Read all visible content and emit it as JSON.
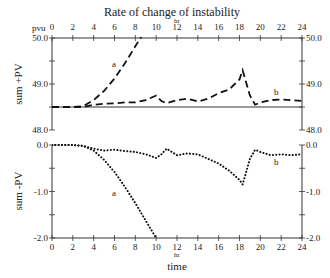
{
  "chart_data": [
    {
      "type": "line",
      "panel": "top",
      "title": "Rate of change of instability",
      "xlabel": "hr",
      "ylabel": "sum +PV",
      "y_unit_label": "pvu",
      "xlim": [
        0,
        24
      ],
      "ylim": [
        48.0,
        50.0
      ],
      "x_ticks": [
        0,
        2,
        4,
        6,
        8,
        10,
        12,
        14,
        16,
        18,
        20,
        22,
        24
      ],
      "y_ticks": [
        48.0,
        49.0,
        50.0
      ],
      "y_tick_labels_left": [
        "48.0",
        "49.0",
        "50.0"
      ],
      "y_tick_labels_right": [
        "48.0",
        "49.0",
        "50.0"
      ],
      "reference_line": 48.5,
      "line_style": "dashed",
      "series": [
        {
          "name": "a",
          "x": [
            0,
            2,
            3,
            4,
            5,
            6,
            7,
            8,
            8.5,
            9
          ],
          "values": [
            48.5,
            48.5,
            48.52,
            48.65,
            48.85,
            49.12,
            49.45,
            49.82,
            50.0,
            50.2
          ]
        },
        {
          "name": "b",
          "x": [
            0,
            2,
            3,
            4,
            5,
            6,
            7,
            8,
            9,
            10,
            10.5,
            11,
            12,
            13,
            14,
            15,
            16,
            17,
            18,
            18.3,
            19,
            19.5,
            20,
            21,
            22,
            23,
            24
          ],
          "values": [
            48.5,
            48.5,
            48.5,
            48.55,
            48.57,
            48.58,
            48.6,
            48.6,
            48.65,
            48.75,
            48.63,
            48.58,
            48.65,
            48.68,
            48.62,
            48.68,
            48.8,
            48.88,
            49.1,
            49.3,
            48.75,
            48.55,
            48.6,
            48.65,
            48.66,
            48.65,
            48.63
          ]
        }
      ]
    },
    {
      "type": "line",
      "panel": "bottom",
      "xlabel": "time",
      "x_unit_label": "hr",
      "ylabel": "sum -PV",
      "xlim": [
        0,
        24
      ],
      "ylim": [
        -2.0,
        0.0
      ],
      "x_ticks": [
        0,
        2,
        4,
        6,
        8,
        10,
        12,
        14,
        16,
        18,
        20,
        22,
        24
      ],
      "y_ticks": [
        -2.0,
        -1.0,
        0.0
      ],
      "y_tick_labels_left": [
        "-2.0",
        "-1.0",
        "0.0"
      ],
      "y_tick_labels_right": [
        "-2.0",
        "-1.0",
        "0.0"
      ],
      "line_style": "dotted",
      "series": [
        {
          "name": "a",
          "x": [
            0,
            2,
            3,
            4,
            5,
            6,
            7,
            8,
            9,
            10
          ],
          "values": [
            0.0,
            0.0,
            -0.02,
            -0.12,
            -0.32,
            -0.58,
            -0.9,
            -1.25,
            -1.63,
            -2.0
          ]
        },
        {
          "name": "b",
          "x": [
            0,
            2,
            3,
            4,
            5,
            6,
            7,
            8,
            9,
            10,
            10.5,
            11,
            12,
            13,
            14,
            15,
            16,
            17,
            18,
            18.3,
            19,
            19.5,
            20,
            21,
            22,
            23,
            24
          ],
          "values": [
            0.0,
            0.0,
            -0.02,
            -0.08,
            -0.12,
            -0.1,
            -0.13,
            -0.15,
            -0.2,
            -0.28,
            -0.2,
            -0.08,
            -0.22,
            -0.18,
            -0.2,
            -0.3,
            -0.4,
            -0.55,
            -0.75,
            -0.85,
            -0.3,
            -0.1,
            -0.15,
            -0.22,
            -0.2,
            -0.22,
            -0.2
          ]
        }
      ]
    }
  ],
  "labels": {
    "title": "Rate of change of instability",
    "top_unit": "pvu",
    "top_hr": "hr",
    "top_ylabel": "sum +PV",
    "bottom_ylabel": "sum -PV",
    "bottom_hr": "hr",
    "bottom_xlabel": "time",
    "curve_a": "a",
    "curve_b": "b"
  }
}
